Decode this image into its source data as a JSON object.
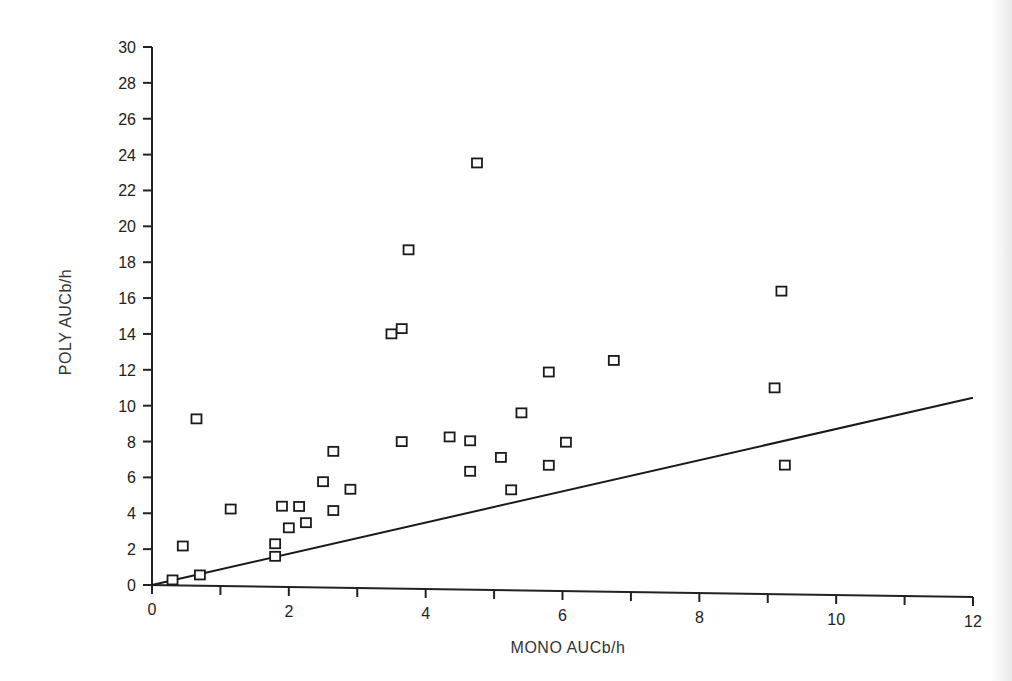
{
  "chart_data": {
    "type": "scatter",
    "title": "",
    "xlabel": "MONO  AUCb/h",
    "ylabel": "POLY  AUCb/h",
    "xlim": [
      0,
      12
    ],
    "ylim": [
      0,
      30
    ],
    "xticks": [
      0,
      1,
      2,
      3,
      4,
      5,
      6,
      7,
      8,
      9,
      10,
      11,
      12
    ],
    "xtick_labels": [
      "0",
      "2",
      "4",
      "6",
      "8",
      "10",
      "12"
    ],
    "yticks": [
      0,
      2,
      4,
      6,
      8,
      10,
      12,
      14,
      16,
      18,
      20,
      22,
      24,
      26,
      28,
      30
    ],
    "ytick_labels": [
      "0",
      "2",
      "4",
      "6",
      "8",
      "10",
      "12",
      "14",
      "16",
      "18",
      "20",
      "22",
      "24",
      "26",
      "28",
      "30"
    ],
    "grid": false,
    "legend": null,
    "marker": "open-square",
    "series": [
      {
        "name": "patients",
        "points": [
          {
            "x": 0.3,
            "y": 0.3
          },
          {
            "x": 0.45,
            "y": 2.2
          },
          {
            "x": 0.65,
            "y": 9.3
          },
          {
            "x": 0.7,
            "y": 0.6
          },
          {
            "x": 1.15,
            "y": 4.3
          },
          {
            "x": 1.8,
            "y": 1.7
          },
          {
            "x": 1.8,
            "y": 2.4
          },
          {
            "x": 1.9,
            "y": 4.5
          },
          {
            "x": 2.0,
            "y": 3.3
          },
          {
            "x": 2.15,
            "y": 4.5
          },
          {
            "x": 2.25,
            "y": 3.6
          },
          {
            "x": 2.5,
            "y": 5.9
          },
          {
            "x": 2.65,
            "y": 4.3
          },
          {
            "x": 2.65,
            "y": 7.6
          },
          {
            "x": 2.9,
            "y": 5.5
          },
          {
            "x": 3.5,
            "y": 14.2
          },
          {
            "x": 3.65,
            "y": 14.5
          },
          {
            "x": 3.65,
            "y": 8.2
          },
          {
            "x": 3.75,
            "y": 18.9
          },
          {
            "x": 4.35,
            "y": 8.5
          },
          {
            "x": 4.65,
            "y": 8.3
          },
          {
            "x": 4.65,
            "y": 6.6
          },
          {
            "x": 4.75,
            "y": 23.8
          },
          {
            "x": 5.1,
            "y": 7.4
          },
          {
            "x": 5.25,
            "y": 5.6
          },
          {
            "x": 5.4,
            "y": 9.9
          },
          {
            "x": 5.8,
            "y": 12.2
          },
          {
            "x": 5.8,
            "y": 7.0
          },
          {
            "x": 6.05,
            "y": 8.3
          },
          {
            "x": 6.75,
            "y": 12.9
          },
          {
            "x": 9.1,
            "y": 11.5
          },
          {
            "x": 9.2,
            "y": 16.9
          },
          {
            "x": 9.25,
            "y": 7.2
          }
        ]
      }
    ],
    "reference_line": {
      "name": "regression line",
      "x": [
        0,
        12
      ],
      "y": [
        0,
        11.0
      ]
    }
  }
}
